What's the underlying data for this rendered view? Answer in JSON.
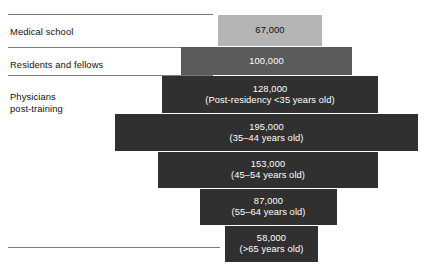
{
  "chart_data": {
    "type": "bar",
    "title": "",
    "subtitle": "",
    "xlabel": "",
    "ylabel": "",
    "orientation": "horizontal-funnel",
    "grid": false,
    "legend": "none",
    "categories": [
      "Medical school",
      "Residents and fellows",
      "Physicians post-training (Post-residency <35 years old)",
      "Physicians post-training (35–44 years old)",
      "Physicians post-training (45–54 years old)",
      "Physicians post-training (55–64 years old)",
      "Physicians post-training (>65 years old)"
    ],
    "values": [
      67000,
      100000,
      128000,
      195000,
      153000,
      87000,
      58000
    ],
    "value_labels": [
      "67,000",
      "100,000",
      "128,000",
      "195,000",
      "153,000",
      "87,000",
      "58,000"
    ],
    "sublabels": [
      "",
      "",
      "(Post-residency <35 years old)",
      "(35–44 years old)",
      "(45–54 years old)",
      "(55–64 years old)",
      "(>65 years old)"
    ],
    "colors": [
      "#b5b5b5",
      "#5a5a5a",
      "#303030",
      "#303030",
      "#303030",
      "#303030",
      "#303030"
    ]
  },
  "group_labels": [
    {
      "text": "Medical school",
      "top": 26
    },
    {
      "text": "Residents and fellows",
      "top": 59
    },
    {
      "text": "Physicians\npost-training",
      "top": 91
    }
  ],
  "rules": [
    {
      "top": 14,
      "width": 205
    },
    {
      "top": 47,
      "width": 205
    },
    {
      "top": 75,
      "width": 205
    },
    {
      "top": 247,
      "width": 212
    }
  ],
  "bars": [
    {
      "name": "bar-medical-school",
      "value_label": "67,000",
      "sublabel": "",
      "left": 218,
      "top": 15,
      "width": 104,
      "height": 31,
      "fill": "#b5b5b5",
      "tone": "light"
    },
    {
      "name": "bar-residents-and-fellows",
      "value_label": "100,000",
      "sublabel": "",
      "left": 181,
      "top": 47,
      "width": 171,
      "height": 28,
      "fill": "#5a5a5a",
      "tone": "mid"
    },
    {
      "name": "bar-post-residency-under-35",
      "value_label": "128,000",
      "sublabel": "(Post-residency <35 years old)",
      "left": 162,
      "top": 76,
      "width": 216,
      "height": 37,
      "fill": "#303030",
      "tone": "dark"
    },
    {
      "name": "bar-age-35-44",
      "value_label": "195,000",
      "sublabel": "(35–44 years old)",
      "left": 115,
      "top": 114,
      "width": 303,
      "height": 37,
      "fill": "#303030",
      "tone": "dark"
    },
    {
      "name": "bar-age-45-54",
      "value_label": "153,000",
      "sublabel": "(45–54 years old)",
      "left": 158,
      "top": 152,
      "width": 220,
      "height": 36,
      "fill": "#303030",
      "tone": "dark"
    },
    {
      "name": "bar-age-55-64",
      "value_label": "87,000",
      "sublabel": "(55–64 years old)",
      "left": 200,
      "top": 189,
      "width": 137,
      "height": 36,
      "fill": "#303030",
      "tone": "dark"
    },
    {
      "name": "bar-age-over-65",
      "value_label": "58,000",
      "sublabel": "(>65 years old)",
      "left": 225,
      "top": 226,
      "width": 93,
      "height": 36,
      "fill": "#303030",
      "tone": "dark"
    }
  ]
}
